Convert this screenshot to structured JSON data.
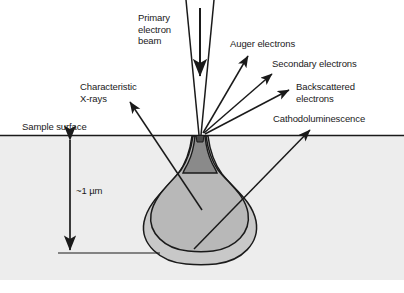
{
  "figure": {
    "surface_label": "Sample surface",
    "depth_label": "~1 µm"
  },
  "labels": {
    "primary_beam": "Primary\nelectron\nbeam",
    "auger": "Auger electrons",
    "secondary": "Secondary electrons",
    "backscattered": "Backscattered\nelectrons",
    "cathodoluminescence": "Cathodoluminescence",
    "characteristic_xrays": "Characteristic\nX-rays",
    "sample_surface": "Sample surface",
    "depth": "~1 µm"
  },
  "colors": {
    "page_background": "#ffffff",
    "sample_region": "#ededed",
    "outer_volume": "#c8c8c8",
    "inner_volume": "#b8b8b8",
    "neck_volume": "#8a8a8a",
    "stroke": "#1a1a1a",
    "text": "#1a1a1a"
  },
  "geometry": {
    "sample_top_y": 135,
    "sample_bottom_y": 280,
    "impact_point": {
      "x": 200,
      "y": 135
    },
    "depth_arrow_x": 70,
    "depth_arrow_top_y": 137,
    "depth_arrow_bottom_y": 253,
    "baseline_y": 253,
    "baseline_x_start": 58,
    "baseline_x_end": 160
  },
  "signals": [
    {
      "name": "auger",
      "label": "Auger electrons",
      "direction": "up-right"
    },
    {
      "name": "secondary",
      "label": "Secondary electrons",
      "direction": "up-right"
    },
    {
      "name": "backscattered",
      "label": "Backscattered electrons",
      "direction": "up-right"
    },
    {
      "name": "cathodoluminescence",
      "label": "Cathodoluminescence",
      "direction": "up-right"
    },
    {
      "name": "characteristic-xrays",
      "label": "Characteristic X-rays",
      "direction": "up-left"
    }
  ]
}
